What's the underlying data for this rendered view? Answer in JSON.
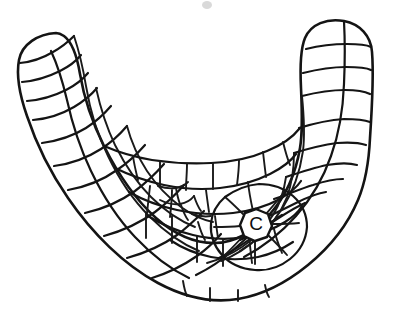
{
  "figure": {
    "kind": "line-drawing",
    "background_color": "#ffffff",
    "ink_color": "#141414",
    "width": 399,
    "height": 314,
    "labels": [
      {
        "id": "central-plate-label",
        "text": "C",
        "x": 256,
        "y": 224,
        "font_size": 19,
        "description": "letter label inside the small central polygonal plate"
      }
    ],
    "artifacts": [
      {
        "id": "stray-speck",
        "x": 207,
        "y": 5,
        "color": "#b9b9b9",
        "description": "faint scanning speck near top edge"
      }
    ],
    "structure": {
      "outline_description": "broad U / boomerang crescent with two upward-pointing rounded arms",
      "left_arm_tip": {
        "x": 30,
        "y": 40
      },
      "right_arm_tip": {
        "x": 358,
        "y": 20
      },
      "trough_bottom": {
        "x": 235,
        "y": 298
      },
      "arc_rows": 5,
      "plate_count_estimate": 96,
      "center_of_radiation": {
        "x": 256,
        "y": 224
      }
    }
  }
}
